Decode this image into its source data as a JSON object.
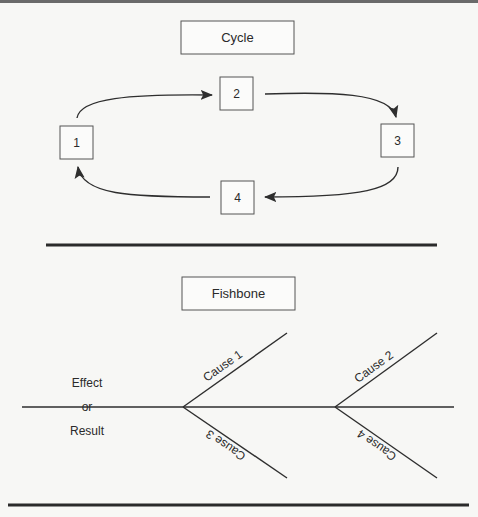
{
  "cycle": {
    "title": "Cycle",
    "nodes": [
      "1",
      "2",
      "3",
      "4"
    ],
    "flow": [
      [
        "1",
        "2"
      ],
      [
        "2",
        "3"
      ],
      [
        "3",
        "4"
      ],
      [
        "4",
        "1"
      ]
    ]
  },
  "fishbone": {
    "title": "Fishbone",
    "effect_lines": [
      "Effect",
      "or",
      "Result"
    ],
    "causes": [
      "Cause 1",
      "Cause 2",
      "Cause 3",
      "Cause 4"
    ]
  }
}
